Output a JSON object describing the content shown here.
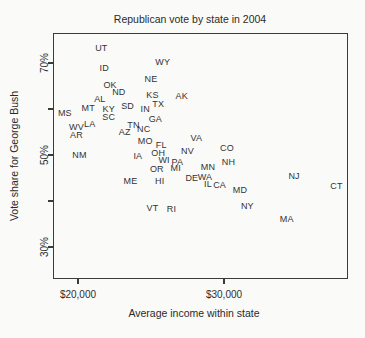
{
  "colors": {
    "background": "#fafaf8",
    "text": "#2e2e2e",
    "frame": "#3b3b3b"
  },
  "chart_data": {
    "type": "scatter",
    "point_style": "state-abbreviation-text",
    "title": "Republican vote by state in 2004",
    "xlabel": "Average income within state",
    "ylabel": "Vote share for George Bush",
    "xlim": [
      18290,
      38490
    ],
    "ylim": [
      23.0,
      76.5
    ],
    "grid": false,
    "x_ticks": [
      {
        "value": 20000,
        "label": "$20,000"
      },
      {
        "value": 30000,
        "label": "$30,000"
      }
    ],
    "y_ticks": [
      {
        "value": 30,
        "label": "30%"
      },
      {
        "value": 40,
        "label": ""
      },
      {
        "value": 50,
        "label": "50%"
      },
      {
        "value": 60,
        "label": ""
      },
      {
        "value": 70,
        "label": "70%"
      }
    ],
    "points": [
      {
        "state": "UT",
        "income": 21600,
        "vote": 73.3
      },
      {
        "state": "ID",
        "income": 21800,
        "vote": 68.9
      },
      {
        "state": "WY",
        "income": 25800,
        "vote": 70.2
      },
      {
        "state": "NE",
        "income": 25000,
        "vote": 66.5
      },
      {
        "state": "OK",
        "income": 22200,
        "vote": 65.2
      },
      {
        "state": "ND",
        "income": 22800,
        "vote": 63.7
      },
      {
        "state": "AL",
        "income": 21500,
        "vote": 62.2
      },
      {
        "state": "KS",
        "income": 25100,
        "vote": 63.0
      },
      {
        "state": "AK",
        "income": 27100,
        "vote": 62.8
      },
      {
        "state": "TX",
        "income": 25500,
        "vote": 61.1
      },
      {
        "state": "MT",
        "income": 20700,
        "vote": 60.2
      },
      {
        "state": "KY",
        "income": 22100,
        "vote": 60.0
      },
      {
        "state": "SD",
        "income": 23400,
        "vote": 60.7
      },
      {
        "state": "IN",
        "income": 24600,
        "vote": 60.0
      },
      {
        "state": "MS",
        "income": 19100,
        "vote": 59.1
      },
      {
        "state": "SC",
        "income": 22100,
        "vote": 58.3
      },
      {
        "state": "GA",
        "income": 25300,
        "vote": 57.8
      },
      {
        "state": "LA",
        "income": 20800,
        "vote": 56.7
      },
      {
        "state": "WV",
        "income": 19900,
        "vote": 56.1
      },
      {
        "state": "TN",
        "income": 23800,
        "vote": 56.5
      },
      {
        "state": "NC",
        "income": 24500,
        "vote": 55.7
      },
      {
        "state": "AZ",
        "income": 23200,
        "vote": 55.0
      },
      {
        "state": "AR",
        "income": 19900,
        "vote": 54.3
      },
      {
        "state": "MO",
        "income": 24600,
        "vote": 53.0
      },
      {
        "state": "VA",
        "income": 28100,
        "vote": 53.6
      },
      {
        "state": "FL",
        "income": 25700,
        "vote": 52.2
      },
      {
        "state": "OH",
        "income": 25500,
        "vote": 50.4
      },
      {
        "state": "NV",
        "income": 27500,
        "vote": 50.9
      },
      {
        "state": "NM",
        "income": 20100,
        "vote": 50.0
      },
      {
        "state": "IA",
        "income": 24100,
        "vote": 49.8
      },
      {
        "state": "WI",
        "income": 25900,
        "vote": 48.9
      },
      {
        "state": "PA",
        "income": 26800,
        "vote": 48.5
      },
      {
        "state": "OR",
        "income": 25400,
        "vote": 47.0
      },
      {
        "state": "MI",
        "income": 26700,
        "vote": 47.1
      },
      {
        "state": "MN",
        "income": 28900,
        "vote": 47.4
      },
      {
        "state": "ME",
        "income": 23600,
        "vote": 44.3
      },
      {
        "state": "HI",
        "income": 25600,
        "vote": 44.3
      },
      {
        "state": "DE",
        "income": 27800,
        "vote": 45.0
      },
      {
        "state": "WA",
        "income": 28700,
        "vote": 45.2
      },
      {
        "state": "IL",
        "income": 28900,
        "vote": 43.7
      },
      {
        "state": "CA",
        "income": 29700,
        "vote": 43.5
      },
      {
        "state": "CO",
        "income": 30200,
        "vote": 51.5
      },
      {
        "state": "NH",
        "income": 30300,
        "vote": 48.5
      },
      {
        "state": "MD",
        "income": 31100,
        "vote": 42.4
      },
      {
        "state": "NJ",
        "income": 34800,
        "vote": 45.4
      },
      {
        "state": "CT",
        "income": 37700,
        "vote": 43.3
      },
      {
        "state": "NY",
        "income": 31600,
        "vote": 38.9
      },
      {
        "state": "VT",
        "income": 25100,
        "vote": 38.5
      },
      {
        "state": "RI",
        "income": 26400,
        "vote": 38.3
      },
      {
        "state": "MA",
        "income": 34300,
        "vote": 36.1
      }
    ]
  }
}
